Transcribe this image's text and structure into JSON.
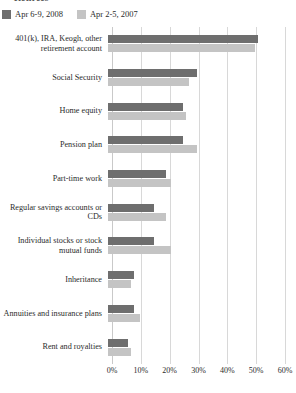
{
  "header": {
    "title": "Retirees"
  },
  "legend": {
    "position": "top-left",
    "items": [
      {
        "label": "Apr 6-9, 2008",
        "color": "#6e6e6e"
      },
      {
        "label": "Apr 2-5, 2007",
        "color": "#c4c4c4"
      }
    ]
  },
  "axis": {
    "ticks": [
      "0%",
      "10%",
      "20%",
      "30%",
      "40%",
      "50%",
      "60%"
    ],
    "min": 0,
    "max": 60,
    "step": 10
  },
  "chart_data": {
    "type": "bar",
    "orientation": "horizontal",
    "title": "Retirees",
    "xlabel": "",
    "ylabel": "",
    "xlim": [
      0,
      60
    ],
    "grid": true,
    "legend_position": "top-left",
    "categories": [
      "401(k), IRA, Keogh, other retirement account",
      "Social Security",
      "Home equity",
      "Pension plan",
      "Part-time work",
      "Regular savings accounts or CDs",
      "Individual stocks or stock mutual funds",
      "Inheritance",
      "Annuities and insurance plans",
      "Rent and royalties"
    ],
    "series": [
      {
        "name": "Apr 6-9, 2008",
        "color": "#6e6e6e",
        "values": [
          52,
          31,
          26,
          26,
          20,
          16,
          16,
          9,
          9,
          7
        ]
      },
      {
        "name": "Apr 2-5, 2007",
        "color": "#c4c4c4",
        "values": [
          51,
          28,
          27,
          31,
          22,
          20,
          22,
          8,
          11,
          8
        ]
      }
    ]
  }
}
